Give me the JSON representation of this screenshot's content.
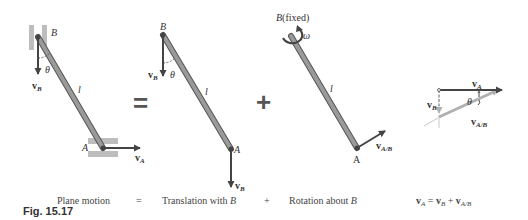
{
  "figure": {
    "caption": "Fig. 15.17",
    "operators": {
      "equals": "=",
      "plus": "+"
    },
    "panels": {
      "plane_motion": {
        "point_top": "B",
        "point_bottom": "A",
        "velocity_top": "v",
        "velocity_top_sub": "B",
        "velocity_bottom": "v",
        "velocity_bottom_sub": "A",
        "angle": "θ",
        "length": "l"
      },
      "translation": {
        "point_top": "B",
        "point_bottom": "A",
        "velocity_top": "v",
        "velocity_top_sub": "B",
        "velocity_bottom": "v",
        "velocity_bottom_sub": "B",
        "angle": "θ",
        "length": "l"
      },
      "rotation": {
        "fixed_label": "B",
        "fixed_suffix": "(fixed)",
        "omega": "ω",
        "point_bottom": "A",
        "velocity": "v",
        "velocity_sub": "A/B",
        "length": "l"
      },
      "vector_triangle": {
        "v_a": "v",
        "v_a_sub": "A",
        "v_b": "v",
        "v_b_sub": "B",
        "v_ab": "v",
        "v_ab_sub": "A/B",
        "angle": "θ"
      }
    },
    "bottom_labels": {
      "plane_motion": "Plane motion",
      "equals": "=",
      "translation_prefix": "Translation with ",
      "translation_point": "B",
      "plus": "+",
      "rotation_prefix": "Rotation about ",
      "rotation_point": "B",
      "equation": {
        "lhs": "v",
        "lhs_sub": "A",
        "eq": " = ",
        "t1": "v",
        "t1_sub": "B",
        "plus": " + ",
        "t2": "v",
        "t2_sub": "A/B"
      }
    },
    "colors": {
      "rod_fill": "#9a9a9a",
      "rod_edge": "#555555",
      "arrow_dark": "#444444",
      "arrow_light": "#b0b0b0",
      "guide": "#c8c8c8"
    }
  }
}
